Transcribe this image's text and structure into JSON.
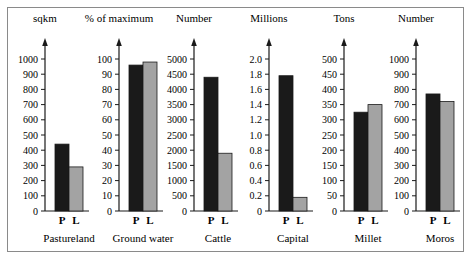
{
  "chart_data": [
    {
      "type": "bar",
      "title": "Pastureland",
      "ylabel": "sqkm",
      "categories": [
        "P",
        "L"
      ],
      "values": [
        440,
        290
      ],
      "ylim": [
        0,
        1000
      ],
      "yticks": [
        "0",
        "100",
        "200",
        "300",
        "400",
        "500",
        "600",
        "700",
        "800",
        "900",
        "1000"
      ]
    },
    {
      "type": "bar",
      "title": "Ground water",
      "ylabel": "% of maximum",
      "categories": [
        "P",
        "L"
      ],
      "values": [
        96,
        98
      ],
      "ylim": [
        0,
        100
      ],
      "yticks": [
        "0",
        "10",
        "20",
        "30",
        "40",
        "50",
        "60",
        "70",
        "80",
        "90",
        "100"
      ]
    },
    {
      "type": "bar",
      "title": "Cattle",
      "ylabel": "Number",
      "categories": [
        "P",
        "L"
      ],
      "values": [
        4400,
        1900
      ],
      "ylim": [
        0,
        5000
      ],
      "yticks": [
        "0",
        "500",
        "1000",
        "1500",
        "2000",
        "2500",
        "3000",
        "3500",
        "4000",
        "4500",
        "5000"
      ]
    },
    {
      "type": "bar",
      "title": "Capital",
      "ylabel": "Millions",
      "categories": [
        "P",
        "L"
      ],
      "values": [
        1.78,
        0.18
      ],
      "ylim": [
        0,
        2.0
      ],
      "yticks": [
        "0",
        "0.2",
        "0.4",
        "0.6",
        "0.8",
        "1.0",
        "1.2",
        "1.4",
        "1.6",
        "1.8",
        "2.0"
      ]
    },
    {
      "type": "bar",
      "title": "Millet",
      "ylabel": "Tons",
      "categories": [
        "P",
        "L"
      ],
      "values": [
        325,
        350
      ],
      "ylim": [
        0,
        500
      ],
      "yticks": [
        "0",
        "50",
        "100",
        "150",
        "200",
        "250",
        "300",
        "350",
        "400",
        "450",
        "500"
      ]
    },
    {
      "type": "bar",
      "title": "Moros",
      "ylabel": "Number",
      "categories": [
        "P",
        "L"
      ],
      "values": [
        770,
        720
      ],
      "ylim": [
        0,
        1000
      ],
      "yticks": [
        "0",
        "100",
        "200",
        "300",
        "400",
        "500",
        "600",
        "700",
        "800",
        "900",
        "1000"
      ]
    }
  ],
  "colors": {
    "P": "#1a1a1a",
    "L": "#a3a3a3",
    "axis": "#1a1a1a",
    "frame": "#8a8a8a"
  },
  "layout": {
    "axis_x": [
      45,
      119,
      194,
      269,
      344,
      416
    ],
    "baseline_y": 211,
    "top_tick_y": 59,
    "bar_width": 14,
    "bar_gap": 10
  }
}
